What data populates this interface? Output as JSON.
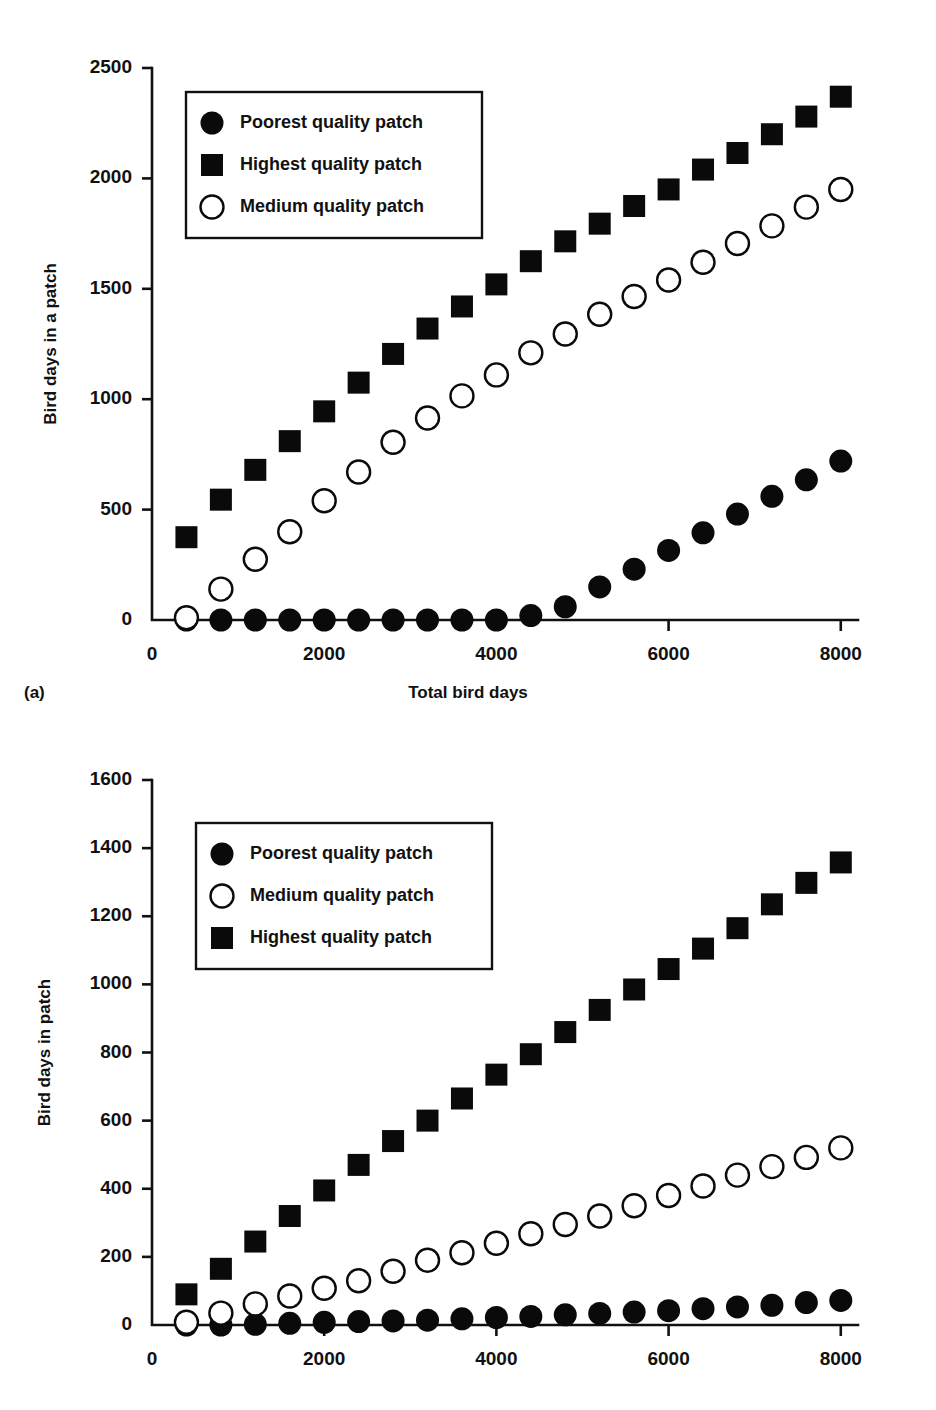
{
  "figure": {
    "panel_a_label": "(a)",
    "shared_xlabel": "Total bird days"
  },
  "chart_data": [
    {
      "type": "scatter",
      "panel": "(a)",
      "title": "",
      "xlabel": "Total bird days",
      "ylabel": "Bird days in a patch",
      "xlim": [
        0,
        8200
      ],
      "ylim": [
        0,
        2500
      ],
      "xticks": [
        0,
        2000,
        4000,
        6000,
        8000
      ],
      "yticks": [
        0,
        500,
        1000,
        1500,
        2000,
        2500
      ],
      "xticklabels": [
        "0",
        "2000",
        "4000",
        "6000",
        "8000"
      ],
      "yticklabels": [
        "0",
        "500",
        "1000",
        "1500",
        "2000",
        "2500"
      ],
      "grid": false,
      "legend_position": "upper-left",
      "x": [
        400,
        800,
        1200,
        1600,
        2000,
        2400,
        2800,
        3200,
        3600,
        4000,
        4400,
        4800,
        5200,
        5600,
        6000,
        6400,
        6800,
        7200,
        7600,
        8000
      ],
      "series": [
        {
          "name": "Poorest quality patch",
          "marker": "filled-circle",
          "color": "#0a0a0a",
          "values": [
            0,
            0,
            0,
            0,
            0,
            0,
            0,
            0,
            0,
            0,
            20,
            60,
            150,
            230,
            315,
            395,
            480,
            560,
            635,
            720
          ]
        },
        {
          "name": "Highest quality patch",
          "marker": "filled-square",
          "color": "#0a0a0a",
          "values": [
            375,
            545,
            680,
            810,
            945,
            1075,
            1205,
            1320,
            1420,
            1520,
            1625,
            1715,
            1795,
            1875,
            1950,
            2040,
            2115,
            2200,
            2280,
            2370
          ]
        },
        {
          "name": "Medium quality patch",
          "marker": "open-circle",
          "color": "#0a0a0a",
          "values": [
            10,
            140,
            275,
            400,
            540,
            670,
            805,
            915,
            1015,
            1110,
            1210,
            1295,
            1385,
            1465,
            1540,
            1620,
            1705,
            1785,
            1870,
            1950
          ]
        }
      ],
      "legend": [
        "Poorest quality patch",
        "Highest quality patch",
        "Medium quality patch"
      ]
    },
    {
      "type": "scatter",
      "panel": "(b)",
      "title": "",
      "xlabel": "",
      "ylabel": "Bird days in patch",
      "xlim": [
        0,
        8200
      ],
      "ylim": [
        0,
        1600
      ],
      "xticks": [
        0,
        2000,
        4000,
        6000,
        8000
      ],
      "yticks": [
        0,
        200,
        400,
        600,
        800,
        1000,
        1200,
        1400,
        1600
      ],
      "xticklabels": [
        "0",
        "2000",
        "4000",
        "6000",
        "8000"
      ],
      "yticklabels": [
        "0",
        "200",
        "400",
        "600",
        "800",
        "1000",
        "1200",
        "1400",
        "1600"
      ],
      "grid": false,
      "legend_position": "upper-left",
      "x": [
        400,
        800,
        1200,
        1600,
        2000,
        2400,
        2800,
        3200,
        3600,
        4000,
        4400,
        4800,
        5200,
        5600,
        6000,
        6400,
        6800,
        7200,
        7600,
        8000
      ],
      "series": [
        {
          "name": "Poorest quality patch",
          "marker": "filled-circle",
          "color": "#0a0a0a",
          "values": [
            0,
            0,
            2,
            5,
            8,
            10,
            12,
            14,
            18,
            22,
            25,
            30,
            34,
            38,
            42,
            48,
            53,
            58,
            66,
            72
          ]
        },
        {
          "name": "Medium quality patch",
          "marker": "open-circle",
          "color": "#0a0a0a",
          "values": [
            8,
            35,
            62,
            85,
            108,
            130,
            158,
            190,
            212,
            240,
            268,
            295,
            320,
            350,
            380,
            408,
            440,
            465,
            492,
            520
          ]
        },
        {
          "name": "Highest quality patch",
          "marker": "filled-square",
          "color": "#0a0a0a",
          "values": [
            90,
            165,
            245,
            320,
            395,
            470,
            540,
            600,
            665,
            735,
            795,
            860,
            925,
            985,
            1045,
            1105,
            1165,
            1235,
            1298,
            1358
          ]
        }
      ],
      "legend": [
        "Poorest quality patch",
        "Medium quality patch",
        "Highest quality patch"
      ]
    }
  ]
}
